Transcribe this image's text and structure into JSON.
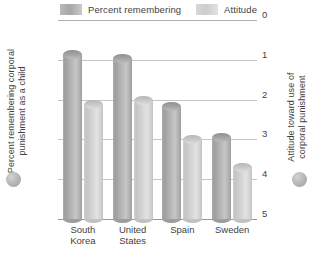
{
  "chart_data": {
    "type": "bar",
    "title": "",
    "categories": [
      "South Korea",
      "United States",
      "Spain",
      "Sweden"
    ],
    "series": [
      {
        "name": "Percent remembering",
        "axis": "left",
        "color": "#aaaaaa",
        "values": [
          83,
          81,
          57,
          41
        ]
      },
      {
        "name": "Attitude",
        "axis": "right",
        "color": "#d4d4d4",
        "values": [
          2.9,
          3.0,
          2.0,
          1.3
        ]
      }
    ],
    "xlabel": "",
    "ylabel": "Percent remembering corporal punishment as a child",
    "y2label": "Attitude toward use of corporal punishment",
    "ylim": [
      0,
      100
    ],
    "y2lim": [
      0,
      5
    ],
    "yticks": [
      0,
      20,
      40,
      60,
      80,
      100
    ],
    "y2ticks": [
      0,
      1,
      2,
      3,
      4,
      5
    ],
    "grid": true,
    "legend_position": "top"
  },
  "legend": {
    "items": [
      {
        "label": "Percent remembering"
      },
      {
        "label": "Attitude"
      }
    ]
  },
  "axes": {
    "left": {
      "title_line1": "Percent remembering corporal",
      "title_line2": "punishment as a child",
      "ticks": [
        "100",
        "80",
        "60",
        "40",
        "20",
        "0"
      ]
    },
    "right": {
      "title_line1": "Attitude toward use of",
      "title_line2": "corporal punishment",
      "ticks": [
        "5",
        "4",
        "3",
        "2",
        "1",
        "0"
      ]
    }
  },
  "categories": [
    {
      "line1": "South",
      "line2": "Korea"
    },
    {
      "line1": "United",
      "line2": "States"
    },
    {
      "line1": "Spain",
      "line2": ""
    },
    {
      "line1": "Sweden",
      "line2": ""
    }
  ]
}
